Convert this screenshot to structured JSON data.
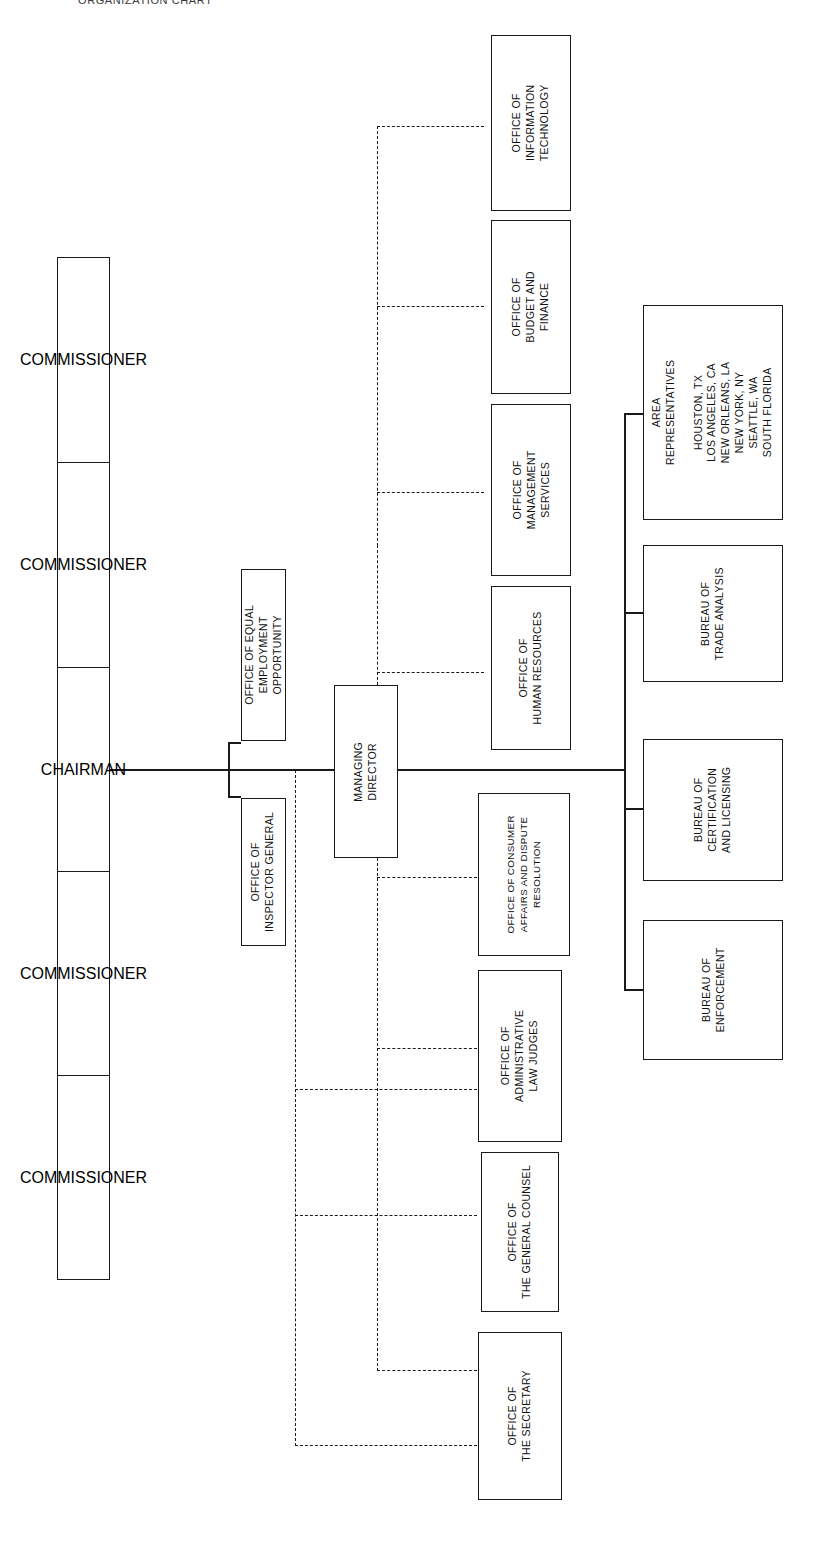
{
  "document": {
    "caption": "ORGANIZATION CHART",
    "orientation": "rotated-90",
    "line_color": "#1a1a1a",
    "background_color": "#ffffff"
  },
  "commission_board": {
    "name": "commission-board-stack",
    "members": [
      {
        "title": "COMMISSIONER"
      },
      {
        "title": "COMMISSIONER"
      },
      {
        "title": "CHAIRMAN"
      },
      {
        "title": "COMMISSIONER"
      },
      {
        "title": "COMMISSIONER"
      }
    ]
  },
  "chairman_staff": {
    "equal_employment": {
      "title": "OFFICE OF EQUAL\nEMPLOYMENT\nOPPORTUNITY",
      "lines": [
        "OFFICE OF EQUAL",
        "EMPLOYMENT",
        "OPPORTUNITY"
      ]
    },
    "inspector_general": {
      "title": "OFFICE OF\nINSPECTOR GENERAL",
      "lines": [
        "OFFICE OF",
        "INSPECTOR GENERAL"
      ]
    }
  },
  "managing_director": {
    "title": "MANAGING\nDIRECTOR",
    "lines": [
      "MANAGING",
      "DIRECTOR"
    ]
  },
  "administrative_offices": [
    {
      "id": "office-of-information-technology",
      "lines": [
        "OFFICE OF",
        "INFORMATION",
        "TECHNOLOGY"
      ]
    },
    {
      "id": "office-of-budget-and-finance",
      "lines": [
        "OFFICE OF",
        "BUDGET AND",
        "FINANCE"
      ]
    },
    {
      "id": "office-of-management-services",
      "lines": [
        "OFFICE OF",
        "MANAGEMENT",
        "SERVICES"
      ]
    },
    {
      "id": "office-of-human-resources",
      "lines": [
        "OFFICE OF",
        "HUMAN RESOURCES"
      ]
    }
  ],
  "program_offices": [
    {
      "id": "office-of-consumer-affairs-and-dispute-resolution",
      "lines": [
        "OFFICE OF CONSUMER",
        "AFFAIRS AND DISPUTE",
        "RESOLUTION"
      ]
    },
    {
      "id": "office-of-administrative-law-judges",
      "lines": [
        "OFFICE OF",
        "ADMINISTRATIVE",
        "LAW JUDGES"
      ]
    },
    {
      "id": "office-of-the-general-counsel",
      "lines": [
        "OFFICE OF",
        "THE GENERAL COUNSEL"
      ]
    },
    {
      "id": "office-of-the-secretary",
      "lines": [
        "OFFICE OF",
        "THE SECRETARY"
      ]
    }
  ],
  "bureaus": [
    {
      "id": "bureau-of-trade-analysis",
      "lines": [
        "BUREAU OF",
        "TRADE ANALYSIS"
      ]
    },
    {
      "id": "bureau-of-certification-and-licensing",
      "lines": [
        "BUREAU OF",
        "CERTIFICATION",
        "AND LICENSING"
      ]
    },
    {
      "id": "bureau-of-enforcement",
      "lines": [
        "BUREAU OF",
        "ENFORCEMENT"
      ]
    }
  ],
  "area_representatives": {
    "heading": [
      "AREA",
      "REPRESENTATIVES"
    ],
    "locations": [
      "HOUSTON, TX",
      "LOS ANGELES, CA",
      "NEW ORLEANS, LA",
      "NEW YORK, NY",
      "SEATTLE, WA",
      "SOUTH FLORIDA"
    ]
  }
}
